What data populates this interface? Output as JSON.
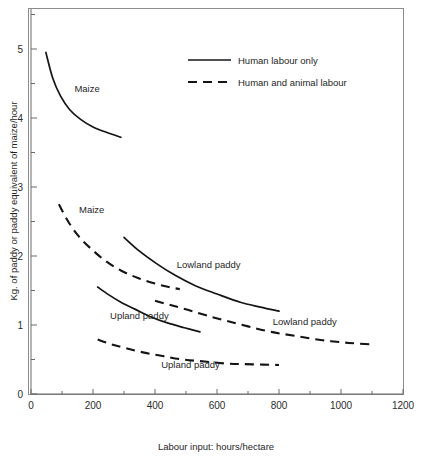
{
  "chart_data": {
    "type": "line",
    "title": "",
    "xlabel": "Labour input: hours/hectare",
    "ylabel": "Kg. of paddy or paddy equivalent of maize/hour",
    "xlim": [
      0,
      1200
    ],
    "ylim": [
      0,
      5.6
    ],
    "x_ticks": [
      0,
      200,
      400,
      600,
      800,
      1000,
      1200
    ],
    "x_tick_labels": [
      "0",
      "200",
      "400",
      "600",
      "800",
      "1000",
      "1200"
    ],
    "x_minor_ticks": [
      100,
      300,
      500,
      700,
      900,
      1100
    ],
    "y_ticks": [
      0,
      1,
      2,
      3,
      4,
      5
    ],
    "y_tick_labels": [
      "0",
      "1",
      "2",
      "3",
      "4",
      "5"
    ],
    "y_minor_ticks": [
      0.5,
      1.5,
      2.5,
      3.5,
      4.5,
      5.5
    ],
    "grid": false,
    "legend_position": "upper-center",
    "legend": [
      {
        "label": "Human labour only",
        "style": "solid"
      },
      {
        "label": "Human and animal labour",
        "style": "dashed"
      }
    ],
    "series": [
      {
        "name": "Maize (human labour only)",
        "label": "Maize",
        "style": "solid",
        "points": [
          [
            48,
            4.95
          ],
          [
            70,
            4.58
          ],
          [
            95,
            4.32
          ],
          [
            125,
            4.12
          ],
          [
            160,
            3.98
          ],
          [
            200,
            3.87
          ],
          [
            245,
            3.79
          ],
          [
            290,
            3.72
          ]
        ]
      },
      {
        "name": "Maize (human and animal labour)",
        "label": "Maize",
        "style": "dashed",
        "points": [
          [
            90,
            2.75
          ],
          [
            120,
            2.5
          ],
          [
            155,
            2.28
          ],
          [
            195,
            2.1
          ],
          [
            240,
            1.93
          ],
          [
            290,
            1.79
          ],
          [
            345,
            1.68
          ],
          [
            400,
            1.6
          ],
          [
            445,
            1.55
          ],
          [
            480,
            1.52
          ]
        ]
      },
      {
        "name": "Lowland paddy (human labour only)",
        "label": "Lowland paddy",
        "style": "solid",
        "points": [
          [
            300,
            2.27
          ],
          [
            350,
            2.07
          ],
          [
            405,
            1.89
          ],
          [
            465,
            1.72
          ],
          [
            530,
            1.57
          ],
          [
            600,
            1.45
          ],
          [
            675,
            1.33
          ],
          [
            740,
            1.26
          ],
          [
            800,
            1.2
          ]
        ]
      },
      {
        "name": "Lowland paddy (human and animal labour)",
        "label": "Lowland paddy",
        "style": "dashed",
        "points": [
          [
            400,
            1.35
          ],
          [
            450,
            1.29
          ],
          [
            505,
            1.22
          ],
          [
            565,
            1.14
          ],
          [
            630,
            1.06
          ],
          [
            700,
            0.98
          ],
          [
            775,
            0.9
          ],
          [
            855,
            0.84
          ],
          [
            940,
            0.78
          ],
          [
            1025,
            0.74
          ],
          [
            1100,
            0.72
          ]
        ]
      },
      {
        "name": "Upland paddy (human labour only)",
        "label": "Upland paddy",
        "style": "solid",
        "points": [
          [
            215,
            1.55
          ],
          [
            250,
            1.44
          ],
          [
            290,
            1.33
          ],
          [
            335,
            1.23
          ],
          [
            385,
            1.12
          ],
          [
            440,
            1.03
          ],
          [
            495,
            0.96
          ],
          [
            545,
            0.9
          ]
        ]
      },
      {
        "name": "Upland paddy (human and animal labour)",
        "label": "Upland paddy",
        "style": "dashed",
        "points": [
          [
            215,
            0.79
          ],
          [
            260,
            0.72
          ],
          [
            310,
            0.66
          ],
          [
            365,
            0.6
          ],
          [
            425,
            0.55
          ],
          [
            490,
            0.5
          ],
          [
            560,
            0.47
          ],
          [
            635,
            0.44
          ],
          [
            715,
            0.43
          ],
          [
            800,
            0.42
          ]
        ]
      }
    ],
    "series_annotations": [
      {
        "text": "Maize",
        "x": 140,
        "y": 4.38,
        "name": "maize-solid"
      },
      {
        "text": "Maize",
        "x": 155,
        "y": 2.62,
        "name": "maize-dashed"
      },
      {
        "text": "Lowland paddy",
        "x": 470,
        "y": 1.82,
        "name": "lowland-solid"
      },
      {
        "text": "Lowland paddy",
        "x": 780,
        "y": 1.0,
        "name": "lowland-dashed"
      },
      {
        "text": "Upland paddy",
        "x": 255,
        "y": 1.09,
        "name": "upland-solid"
      },
      {
        "text": "Upland paddy",
        "x": 420,
        "y": 0.37,
        "name": "upland-dashed"
      }
    ]
  }
}
